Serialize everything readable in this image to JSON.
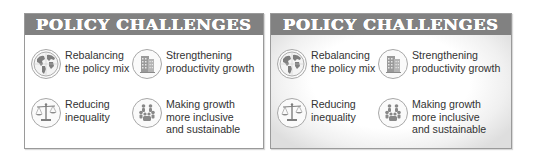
{
  "panels": [
    {
      "variant": "plain",
      "title": "POLICY CHALLENGES",
      "items": [
        {
          "icon": "globe-icon",
          "lines": [
            "Rebalancing",
            "the policy mix"
          ]
        },
        {
          "icon": "building-icon",
          "lines": [
            "Strengthening",
            "productivity growth"
          ]
        },
        {
          "icon": "scales-icon",
          "lines": [
            "Reducing",
            "inequality"
          ]
        },
        {
          "icon": "people-group-icon",
          "lines": [
            "Making growth",
            "more inclusive",
            "and sustainable"
          ]
        }
      ]
    },
    {
      "variant": "vignette",
      "title": "POLICY CHALLENGES",
      "items": [
        {
          "icon": "globe-icon",
          "lines": [
            "Rebalancing",
            "the policy mix"
          ]
        },
        {
          "icon": "building-icon",
          "lines": [
            "Strengthening",
            "productivity growth"
          ]
        },
        {
          "icon": "scales-icon",
          "lines": [
            "Reducing",
            "inequality"
          ]
        },
        {
          "icon": "people-group-icon",
          "lines": [
            "Making growth",
            "more inclusive",
            "and sustainable"
          ]
        }
      ]
    }
  ],
  "colors": {
    "header_bg": "#818181",
    "header_text": "#ffffff",
    "body_text": "#333333",
    "icon_ring": "#a8a8a8",
    "icon_fill": "#8a8a8a",
    "border": "#9a9a9a"
  }
}
